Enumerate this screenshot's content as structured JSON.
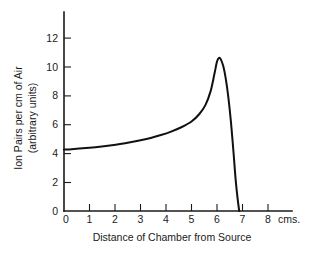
{
  "chart_data": {
    "type": "line",
    "title": "",
    "xlabel": "Distance of Chamber from Source",
    "ylabel_line1": "Ion Pairs per cm of Air",
    "ylabel_line2": "(arbitrary units)",
    "x_unit": "cms.",
    "xlim": [
      0,
      8.6
    ],
    "ylim": [
      0,
      12.9
    ],
    "grid": false,
    "legend": false,
    "x_ticks": [
      0,
      1,
      2,
      3,
      4,
      5,
      6,
      7,
      8
    ],
    "x_tick_labels": [
      "0",
      "1",
      "2",
      "3",
      "4",
      "5",
      "6",
      "7",
      "8"
    ],
    "y_ticks": [
      0,
      2,
      4,
      6,
      8,
      10,
      12
    ],
    "y_tick_labels": [
      "0",
      "2",
      "4",
      "6",
      "8",
      "10",
      "12"
    ],
    "series": [
      {
        "name": "Bragg ionization curve",
        "color": "#111111",
        "x": [
          0.0,
          0.3,
          0.6,
          1.0,
          1.4,
          1.8,
          2.2,
          2.6,
          3.0,
          3.4,
          3.8,
          4.2,
          4.6,
          5.0,
          5.3,
          5.55,
          5.75,
          5.9,
          6.0,
          6.08,
          6.15,
          6.25,
          6.35,
          6.45,
          6.55,
          6.65,
          6.72,
          6.78,
          6.83,
          6.87
        ],
        "y": [
          4.25,
          4.28,
          4.32,
          4.38,
          4.45,
          4.54,
          4.64,
          4.76,
          4.9,
          5.06,
          5.26,
          5.5,
          5.8,
          6.2,
          6.7,
          7.35,
          8.3,
          9.5,
          10.35,
          10.6,
          10.5,
          10.0,
          9.1,
          7.8,
          6.1,
          4.0,
          2.4,
          1.3,
          0.55,
          0.0
        ]
      }
    ],
    "annotations": []
  }
}
